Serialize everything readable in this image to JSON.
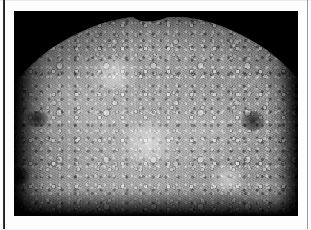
{
  "page": {
    "name": "scanned-document-page",
    "background_color": "#fdfdfd",
    "width_px": 311,
    "height_px": 230,
    "rules": {
      "left_rule_color": "#141414",
      "right_rule_color": "#9a9a9a"
    }
  },
  "figure": {
    "name": "planetary-photograph",
    "frame": {
      "x": 14,
      "y": 11,
      "width": 284,
      "height": 205,
      "border_color": "#050505",
      "background_color": "#050505"
    },
    "caption": "",
    "subject": {
      "body_type": "cratered planetary sphere",
      "illumination": "sunlit from upper left, terminator toward lower left",
      "surface": "densely cratered regolith with bright ray streaks and dark mottled basins",
      "limb_feature": "dark elongated data gap notch along the upper limb"
    },
    "colors": {
      "space": "#050505",
      "highlight": "#e8e8e8",
      "midtone": "#8d8d8d",
      "shadow": "#111111"
    }
  }
}
